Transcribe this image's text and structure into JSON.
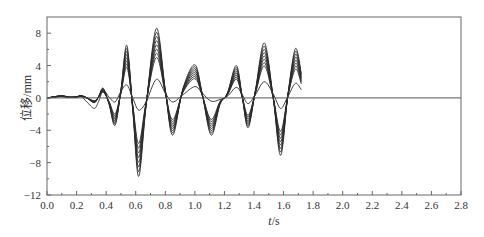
{
  "chart_data": {
    "type": "line",
    "title": "",
    "xlabel": "t/s",
    "xlabel_italic_part": "t",
    "xlabel_unit": "/s",
    "ylabel": "位移/mm",
    "xlim": [
      0.0,
      2.8
    ],
    "ylim": [
      -12,
      10
    ],
    "xticks": [
      "0.0",
      "0.2",
      "0.4",
      "0.6",
      "0.8",
      "1.0",
      "1.2",
      "1.4",
      "1.6",
      "1.8",
      "2.0",
      "2.2",
      "2.4",
      "2.6",
      "2.8"
    ],
    "yticks": [
      "8",
      "4",
      "0",
      "-4",
      "-8",
      "-12"
    ],
    "ytick_values": [
      8,
      4,
      0,
      -4,
      -8,
      -12
    ],
    "grid": false,
    "legend": null,
    "zero_line": true,
    "envelope": {
      "x": [
        0.0,
        0.05,
        0.1,
        0.15,
        0.2,
        0.23,
        0.27,
        0.32,
        0.35,
        0.38,
        0.42,
        0.46,
        0.5,
        0.54,
        0.58,
        0.62,
        0.67,
        0.74,
        0.8,
        0.85,
        0.92,
        1.0,
        1.05,
        1.11,
        1.17,
        1.22,
        1.28,
        1.32,
        1.36,
        1.41,
        1.47,
        1.53,
        1.58,
        1.63,
        1.68,
        1.72
      ],
      "max_series": [
        0.0,
        0.15,
        0.3,
        0.1,
        0.15,
        0.3,
        0.0,
        -0.6,
        0.2,
        1.2,
        -0.8,
        -3.4,
        1.0,
        6.5,
        -1.5,
        -9.7,
        -1.0,
        8.6,
        1.0,
        -4.6,
        1.2,
        4.1,
        0.5,
        -4.6,
        -0.8,
        0.6,
        4.0,
        0.2,
        -3.7,
        1.0,
        6.8,
        0.0,
        -7.1,
        0.5,
        6.1,
        3.0
      ],
      "low_series": [
        0.0,
        0.1,
        0.25,
        0.05,
        0.1,
        0.2,
        -0.5,
        -1.3,
        -0.4,
        0.9,
        0.1,
        -0.5,
        0.8,
        1.6,
        0.0,
        -1.5,
        -0.5,
        2.3,
        0.6,
        -0.5,
        0.4,
        1.4,
        0.6,
        -0.4,
        -0.2,
        0.2,
        1.3,
        0.4,
        -0.7,
        0.4,
        2.0,
        0.5,
        -1.3,
        0.2,
        1.8,
        1.0
      ]
    },
    "series_scale_factors": [
      1.0,
      0.94,
      0.88,
      0.82,
      0.76,
      0.7,
      0.64,
      0.58
    ],
    "series": [
      {
        "name": "curve-1",
        "scale": 1.0
      },
      {
        "name": "curve-2",
        "scale": 0.94
      },
      {
        "name": "curve-3",
        "scale": 0.88
      },
      {
        "name": "curve-4",
        "scale": 0.82
      },
      {
        "name": "curve-5",
        "scale": 0.76
      },
      {
        "name": "curve-6",
        "scale": 0.7
      },
      {
        "name": "curve-7",
        "scale": 0.64
      },
      {
        "name": "curve-8",
        "scale": 0.58
      },
      {
        "name": "curve-low",
        "scale": "low_series"
      }
    ],
    "annotations": [],
    "colors": {
      "line": "#2a2a2a",
      "axis": "#666666",
      "zero_line": "#555555"
    }
  }
}
